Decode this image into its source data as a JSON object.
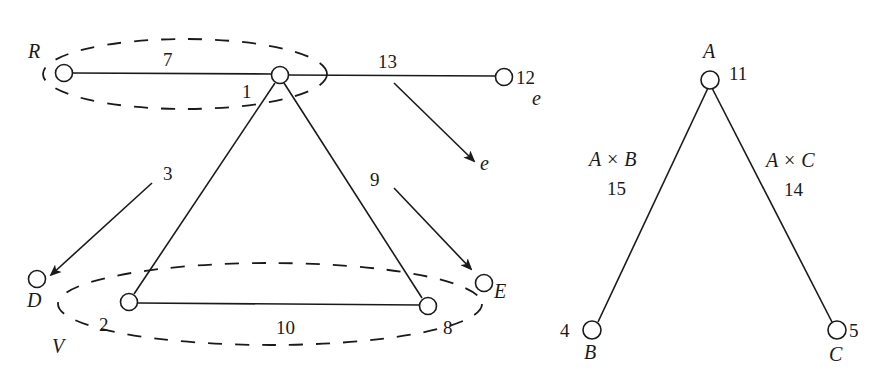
{
  "diagram": {
    "left_graph": {
      "nodes": [
        {
          "id": "R",
          "label": "R",
          "number": ""
        },
        {
          "id": "n1",
          "label": "",
          "number": "1"
        },
        {
          "id": "n12",
          "label": "e",
          "number": "12"
        },
        {
          "id": "n2",
          "label": "",
          "number": "2"
        },
        {
          "id": "n8",
          "label": "",
          "number": "8"
        },
        {
          "id": "D",
          "label": "D",
          "number": ""
        },
        {
          "id": "E",
          "label": "E",
          "number": ""
        }
      ],
      "edges": [
        {
          "from": "R",
          "to": "n1",
          "label": "7"
        },
        {
          "from": "n1",
          "to": "n12",
          "label": "13"
        },
        {
          "from": "n1",
          "to": "n2",
          "label": ""
        },
        {
          "from": "n1",
          "to": "n8",
          "label": "9"
        },
        {
          "from": "n2",
          "to": "n8",
          "label": "10"
        }
      ],
      "arrows": [
        {
          "label": "3",
          "target": "D"
        },
        {
          "label": "9",
          "target": "E"
        },
        {
          "label": "13",
          "target": "e"
        }
      ],
      "groups": [
        {
          "label": "",
          "members": [
            "R",
            "n1"
          ]
        },
        {
          "label": "V",
          "members": [
            "n2",
            "n8"
          ]
        }
      ],
      "text": {
        "R": "R",
        "one": "1",
        "seven": "7",
        "thirteen": "13",
        "twelve": "12",
        "e_node": "e",
        "e_arrow": "e",
        "three": "3",
        "nine": "9",
        "D": "D",
        "E": "E",
        "two": "2",
        "ten": "10",
        "eight": "8",
        "V": "V"
      }
    },
    "right_graph": {
      "nodes": [
        {
          "id": "A",
          "label": "A",
          "number": "11"
        },
        {
          "id": "B",
          "label": "B",
          "number": "4"
        },
        {
          "id": "C",
          "label": "C",
          "number": "5"
        }
      ],
      "edges": [
        {
          "from": "A",
          "to": "B",
          "label": "A × B",
          "number": "15"
        },
        {
          "from": "A",
          "to": "C",
          "label": "A × C",
          "number": "14"
        }
      ],
      "text": {
        "A": "A",
        "eleven": "11",
        "AxB": "A × B",
        "fifteen": "15",
        "AxC": "A × C",
        "fourteen": "14",
        "four": "4",
        "B": "B",
        "five": "5",
        "C": "C"
      }
    }
  }
}
